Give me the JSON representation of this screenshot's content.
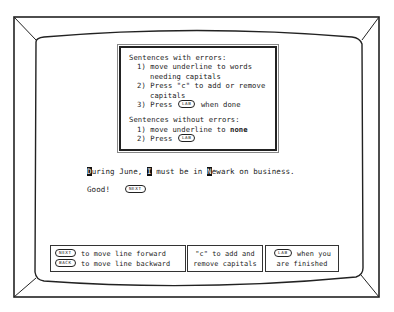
{
  "instructions": {
    "with_errors_title": "Sentences with errors:",
    "with_errors_steps": [
      {
        "num": "1)",
        "line1": "move underline to words",
        "line2": "needing capitals"
      },
      {
        "num": "2)",
        "line1": "Press \"c\" to add or remove",
        "line2": "capitals"
      },
      {
        "num": "3)",
        "pre": "Press",
        "key": "LAB",
        "post": "when done"
      }
    ],
    "without_errors_title": "Sentences without errors:",
    "without_errors_steps": [
      {
        "num": "1)",
        "pre": "move underline to",
        "bold": "none"
      },
      {
        "num": "2)",
        "pre": "Press",
        "key": "LAB"
      }
    ]
  },
  "sentence": {
    "parts": [
      {
        "text": "D",
        "highlight": true
      },
      {
        "text": "uring June, ",
        "highlight": false
      },
      {
        "text": "I",
        "highlight": true
      },
      {
        "text": " must be in ",
        "highlight": false
      },
      {
        "text": "N",
        "highlight": true
      },
      {
        "text": "ewark on business.",
        "highlight": false
      }
    ]
  },
  "feedback": {
    "text": "Good!",
    "key": "NEXT"
  },
  "help_bar": {
    "box1": {
      "key1": "NEXT",
      "line1": "to move line forward",
      "key2": "BACK",
      "line2": "to move line backward"
    },
    "box2": {
      "line1": "\"c\" to add and",
      "line2": "remove capitals"
    },
    "box3": {
      "key": "LAB",
      "line1": "when you",
      "line2": "are finished"
    }
  }
}
